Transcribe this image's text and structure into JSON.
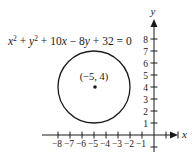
{
  "equation": {
    "parts": [
      "x",
      "2",
      " + ",
      "y",
      "2",
      " + 10",
      "x",
      " − 8",
      "y",
      " + 32 = 0"
    ]
  },
  "center_label": "(−5, 4)",
  "axes": {
    "x_label": "x",
    "y_label": "y",
    "x_ticks": [
      -8,
      -7,
      -6,
      -5,
      -4,
      -3,
      -2,
      -1,
      1,
      2
    ],
    "x_tick_labels": [
      "−8",
      "−7",
      "−6",
      "−5",
      "−4",
      "−3",
      "−2",
      "−1"
    ],
    "x_tick_label_values": [
      -8,
      -7,
      -6,
      -5,
      -4,
      -3,
      -2,
      -1
    ],
    "y_ticks": [
      1,
      2,
      3,
      4,
      5,
      6,
      7,
      8,
      -1
    ],
    "y_tick_labels": [
      "1",
      "2",
      "3",
      "4",
      "5",
      "6",
      "7",
      "8"
    ],
    "y_tick_label_values": [
      1,
      2,
      3,
      4,
      5,
      6,
      7,
      8
    ]
  },
  "circle": {
    "center": [
      -5,
      4
    ],
    "radius": 3
  },
  "colors": {
    "ink": "#1a1a1a"
  }
}
